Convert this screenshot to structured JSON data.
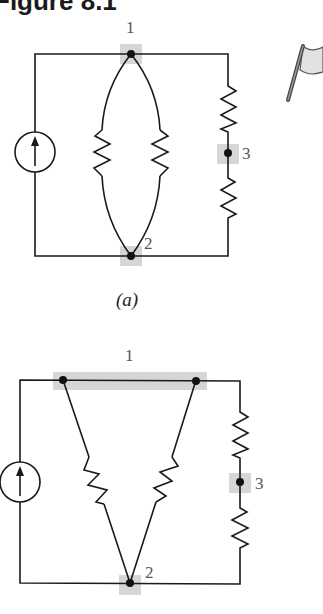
{
  "figure": {
    "title": "Figure 8.1",
    "panels": [
      {
        "id": "a",
        "caption": "(a)",
        "nodes": [
          {
            "label": "1",
            "highlight": true
          },
          {
            "label": "2",
            "highlight": true
          },
          {
            "label": "3",
            "highlight": true
          }
        ],
        "components": [
          "current-source",
          "resistor",
          "resistor",
          "resistor",
          "resistor"
        ]
      },
      {
        "id": "b",
        "caption": "",
        "nodes": [
          {
            "label": "1",
            "highlight": true
          },
          {
            "label": "2",
            "highlight": true
          },
          {
            "label": "3",
            "highlight": true
          }
        ],
        "components": [
          "current-source",
          "resistor",
          "resistor",
          "resistor",
          "resistor"
        ]
      }
    ],
    "icons": [
      "flag-icon"
    ]
  }
}
